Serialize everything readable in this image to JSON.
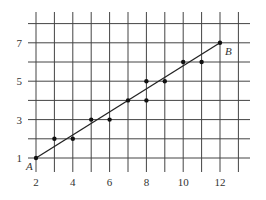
{
  "chart_data": {
    "type": "scatter",
    "title": "",
    "xlabel": "",
    "ylabel": "",
    "xlim": [
      2,
      13
    ],
    "ylim": [
      0,
      8
    ],
    "grid": true,
    "x_ticks": [
      2,
      4,
      6,
      8,
      10,
      12
    ],
    "y_ticks": [
      1,
      3,
      5,
      7
    ],
    "x_tick_labels": [
      "2",
      "4",
      "6",
      "8",
      "10",
      "12"
    ],
    "y_tick_labels": [
      "1",
      "3",
      "5",
      "7"
    ],
    "series": [
      {
        "name": "points",
        "x": [
          2,
          3,
          4,
          5,
          6,
          7,
          8,
          8,
          9,
          10,
          11,
          12
        ],
        "y": [
          1,
          2,
          2,
          3,
          3,
          4,
          4,
          5,
          5,
          6,
          6,
          7
        ]
      }
    ],
    "line": {
      "from": {
        "x": 2,
        "y": 1,
        "label": "A"
      },
      "to": {
        "x": 12,
        "y": 7,
        "label": "B"
      }
    },
    "annotations": [
      "A",
      "B"
    ],
    "legend": null
  }
}
